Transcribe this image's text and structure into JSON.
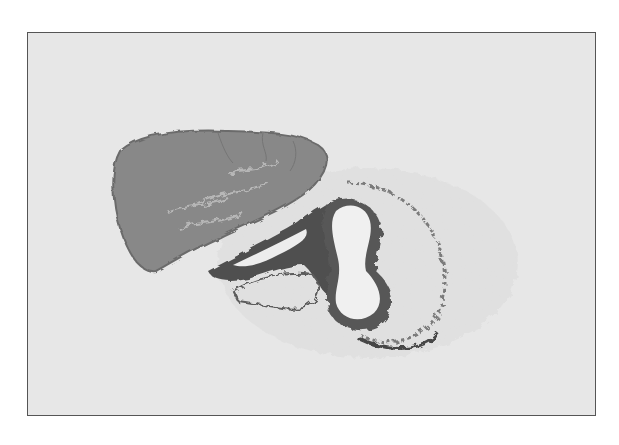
{
  "image": {
    "kind": "grayscale histology micrograph",
    "description": "Tissue section showing a dense lobular gland mass (upper left) adjacent to a duct/vessel with an irregular lumen surrounded by loose connective tissue",
    "colors": {
      "background": "#e9e9e9",
      "frame_border": "#555555",
      "gland": "#8a8a8a",
      "dark_tissue": "#4a4a4a",
      "lumen": "#f2f2f2"
    },
    "caption": ""
  }
}
